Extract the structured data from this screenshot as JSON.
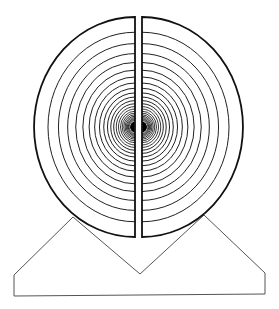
{
  "caption": {
    "text": "",
    "note": "top text line cropped off, only descender fragments visible"
  },
  "diagram": {
    "colors": {
      "outline": "#111111",
      "rings": "#222222",
      "base": "#555555",
      "background": "#ffffff"
    },
    "disk": {
      "center_y": 127,
      "left_half_center_x": 135,
      "right_half_center_x": 142,
      "outer_radius_x": 101,
      "outer_radius_y": 110,
      "ring_count": 22,
      "first_ring_radius_x": 87,
      "ring_decay": 0.88,
      "center_dot_radius": 5
    },
    "base": {
      "points": [
        [
          14,
          275
        ],
        [
          73,
          217
        ],
        [
          140,
          274
        ],
        [
          204,
          215
        ],
        [
          265,
          273
        ],
        [
          265,
          294
        ],
        [
          14,
          296
        ]
      ]
    }
  }
}
